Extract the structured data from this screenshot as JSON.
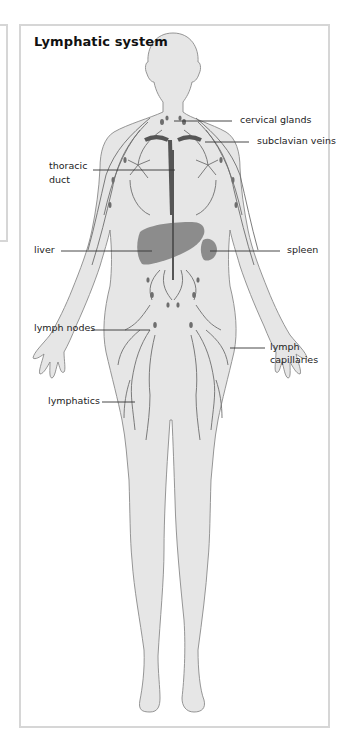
{
  "title": "Lymphatic system",
  "labels": {
    "cervical_glands": "cervical glands",
    "subclavian_veins": "subclavian veins",
    "thoracic_duct_line1": "thoracic",
    "thoracic_duct_line2": "duct",
    "liver": "liver",
    "spleen": "spleen",
    "lymph_nodes": "lymph nodes",
    "lymph_capillaries_line1": "lymph",
    "lymph_capillaries_line2": "capillaries",
    "lymphatics": "lymphatics"
  },
  "colors": {
    "frame_border": "#d6d6d6",
    "body_fill": "#e6e6e6",
    "body_outline": "#8a8a8a",
    "lymph_vessel": "#6e6e6e",
    "organ_fill": "#8c8c8c",
    "leader_line": "#333333"
  }
}
